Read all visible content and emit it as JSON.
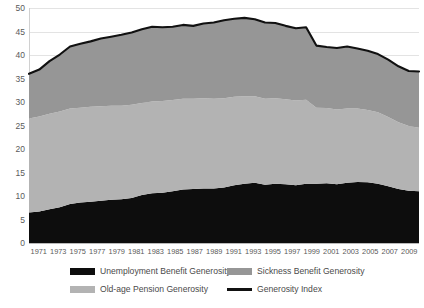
{
  "chart_data": {
    "type": "area",
    "stacked": true,
    "title": "",
    "xlabel": "",
    "ylabel": "",
    "ylim": [
      0,
      50
    ],
    "ytick_step": 5,
    "yticks": [
      "0",
      "5",
      "10",
      "15",
      "20",
      "25",
      "30",
      "35",
      "40",
      "45",
      "50"
    ],
    "grid": true,
    "legend_position": "bottom",
    "x": [
      1971,
      1972,
      1973,
      1974,
      1975,
      1976,
      1977,
      1978,
      1979,
      1980,
      1981,
      1982,
      1983,
      1984,
      1985,
      1986,
      1987,
      1988,
      1989,
      1990,
      1991,
      1992,
      1993,
      1994,
      1995,
      1996,
      1997,
      1998,
      1999,
      2000,
      2001,
      2002,
      2003,
      2004,
      2005,
      2006,
      2007,
      2008,
      2009
    ],
    "xtick_labels": [
      "1971",
      "1973",
      "1975",
      "1977",
      "1979",
      "1981",
      "1983",
      "1985",
      "1987",
      "1989",
      "1991",
      "1993",
      "1995",
      "1997",
      "1999",
      "2001",
      "2003",
      "2005",
      "2007",
      "2009"
    ],
    "series": [
      {
        "name": "Unemployment Benefit Generosity",
        "color": "#0d0d0d",
        "stack_order": 1,
        "values": [
          6.5,
          6.7,
          7.2,
          7.6,
          8.3,
          8.6,
          8.8,
          9.0,
          9.2,
          9.3,
          9.6,
          10.2,
          10.6,
          10.7,
          11.0,
          11.4,
          11.5,
          11.6,
          11.6,
          11.8,
          12.3,
          12.6,
          12.8,
          12.4,
          12.6,
          12.5,
          12.3,
          12.6,
          12.6,
          12.7,
          12.5,
          12.8,
          13.0,
          12.9,
          12.6,
          12.1,
          11.5,
          11.1,
          11.0
        ]
      },
      {
        "name": "Old-age Pension Generosity",
        "color": "#b3b3b3",
        "stack_order": 2,
        "values": [
          20.0,
          20.2,
          20.3,
          20.4,
          20.3,
          20.2,
          20.2,
          20.1,
          20.0,
          19.9,
          19.8,
          19.6,
          19.5,
          19.5,
          19.4,
          19.3,
          19.2,
          19.2,
          19.1,
          19.0,
          18.8,
          18.6,
          18.4,
          18.3,
          18.2,
          18.1,
          18.0,
          17.9,
          16.2,
          16.0,
          15.9,
          15.8,
          15.6,
          15.4,
          15.2,
          14.7,
          14.2,
          13.8,
          13.5
        ]
      },
      {
        "name": "Sickness Benefit Generosity",
        "color": "#969696",
        "stack_order": 3,
        "values": [
          9.5,
          10.0,
          11.2,
          12.1,
          13.2,
          13.6,
          13.9,
          14.4,
          14.7,
          15.1,
          15.4,
          15.7,
          15.9,
          15.7,
          15.6,
          15.7,
          15.5,
          15.9,
          16.2,
          16.6,
          16.6,
          16.7,
          16.4,
          16.2,
          16.0,
          15.6,
          15.4,
          15.4,
          13.2,
          13.0,
          13.1,
          13.2,
          12.8,
          12.6,
          12.4,
          12.2,
          11.9,
          11.7,
          12.0
        ]
      }
    ],
    "line_series": {
      "name": "Generosity Index",
      "color": "#111111",
      "values": [
        36.0,
        36.9,
        38.7,
        40.1,
        41.8,
        42.4,
        42.9,
        43.5,
        43.9,
        44.3,
        44.8,
        45.5,
        46.0,
        45.9,
        46.0,
        46.4,
        46.2,
        46.7,
        46.9,
        47.4,
        47.7,
        47.9,
        47.6,
        46.9,
        46.8,
        46.2,
        45.7,
        45.9,
        42.0,
        41.7,
        41.5,
        41.8,
        41.4,
        40.9,
        40.2,
        39.0,
        37.6,
        36.6,
        36.5
      ]
    }
  },
  "legend": {
    "items": [
      {
        "label": "Unemployment Benefit Generosity",
        "marker": "swatch",
        "color": "#0d0d0d"
      },
      {
        "label": "Sickness Benefit Generosity",
        "marker": "swatch",
        "color": "#969696"
      },
      {
        "label": "Old-age Pension Generosity",
        "marker": "swatch",
        "color": "#b3b3b3"
      },
      {
        "label": "Generosity Index",
        "marker": "line",
        "color": "#111111"
      }
    ]
  }
}
